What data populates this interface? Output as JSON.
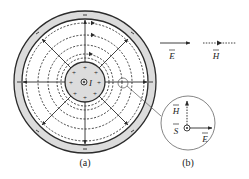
{
  "figure": {
    "panel_a": {
      "label": "(a)",
      "center_symbol": "⊙",
      "current_label": "I",
      "inner_conductor_charge": "+",
      "outer_conductor_charge": "−"
    },
    "legend": {
      "e_field": {
        "label": "E",
        "line_style": "solid"
      },
      "h_field": {
        "label": "H",
        "line_style": "dotted"
      }
    },
    "panel_b": {
      "label": "(b)",
      "h_label": "H",
      "s_label": "S",
      "e_label": "E"
    },
    "colors": {
      "stroke": "#2b2b2b",
      "fill_conductor": "#dcdcdc",
      "background": "#ffffff"
    }
  }
}
